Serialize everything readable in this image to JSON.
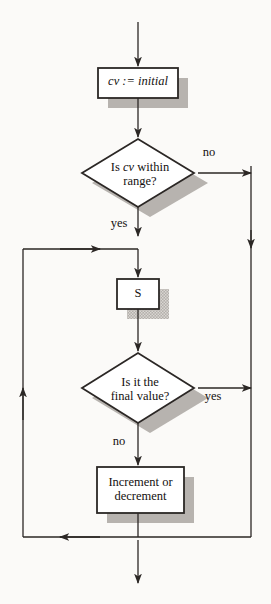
{
  "diagram": {
    "background_color": "#fbfaf8",
    "line_color": "#2b2725",
    "shadow_color": "#b3afab",
    "fill_color": "#ffffff",
    "nodes": [
      {
        "id": "init",
        "type": "process",
        "label": "cv := initial",
        "emphasis": "italic"
      },
      {
        "id": "d1",
        "type": "decision",
        "label": "Is cv within\nrange?"
      },
      {
        "id": "s",
        "type": "process",
        "label": "S"
      },
      {
        "id": "d2",
        "type": "decision",
        "label": "Is it the\nfinal value?"
      },
      {
        "id": "incr",
        "type": "process",
        "label": "Increment or\ndecrement"
      }
    ],
    "edge_labels": {
      "d1_no": "no",
      "d1_yes": "yes",
      "d2_yes": "yes",
      "d2_no": "no"
    }
  }
}
